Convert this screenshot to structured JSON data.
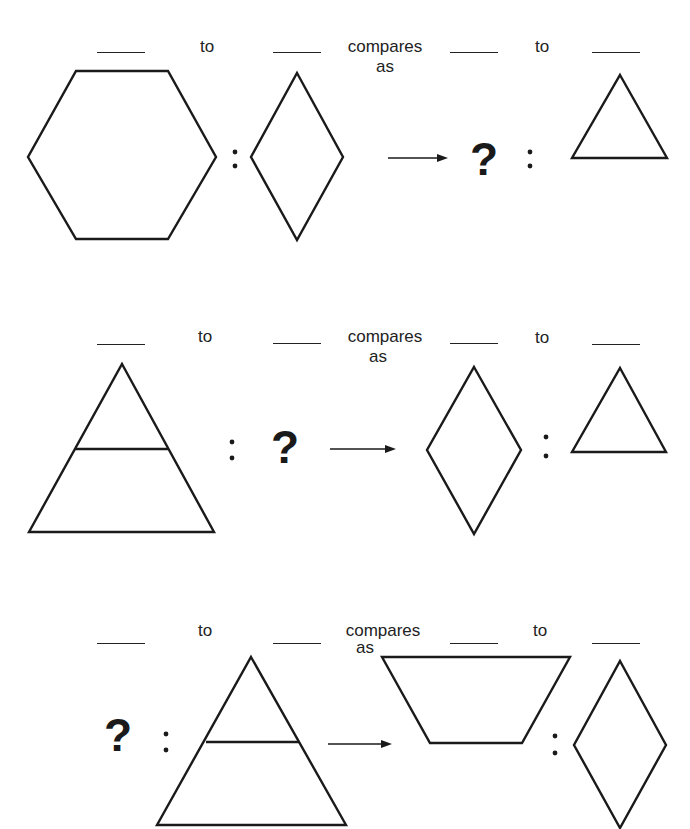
{
  "rows": [
    {
      "id": "row-1",
      "text": {
        "to_1": "to",
        "compares": "compares",
        "as": "as",
        "to_2": "to"
      },
      "question": "?",
      "colon": ":",
      "shapes": [
        "hexagon",
        "rhombus",
        "arrow",
        "question-mark",
        "triangle"
      ]
    },
    {
      "id": "row-2",
      "text": {
        "to_1": "to",
        "compares": "compares",
        "as": "as",
        "to_2": "to"
      },
      "question": "?",
      "colon": ":",
      "shapes": [
        "large-triangle-divided",
        "question-mark",
        "arrow",
        "rhombus",
        "triangle"
      ]
    },
    {
      "id": "row-3",
      "text": {
        "to_1": "to",
        "compares": "compares",
        "as": "as",
        "to_2": "to"
      },
      "question": "?",
      "colon": ":",
      "shapes": [
        "question-mark",
        "large-triangle-divided",
        "arrow",
        "trapezoid",
        "rhombus"
      ]
    }
  ]
}
